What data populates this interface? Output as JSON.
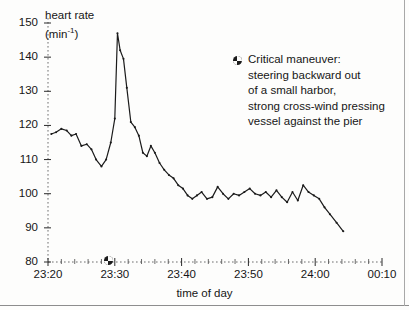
{
  "figure": {
    "background_color": "#fdfdfc",
    "line_color": "#1b1b1b",
    "axis_color": "#6f6f6f"
  },
  "axes": {
    "y_title_line1": "heart rate",
    "y_title_line2": "(min",
    "y_title_exponent": "-1",
    "y_title_line2_close": ")",
    "x_title": "time of day",
    "y_ticks": [
      "80",
      "90",
      "100",
      "110",
      "120",
      "130",
      "140",
      "150"
    ],
    "x_ticks": [
      "23:20",
      "23:30",
      "23:40",
      "23:50",
      "24:00",
      "00:10"
    ]
  },
  "annotation": {
    "marker_icon": "dot-marker-icon",
    "lines": [
      "Critical maneuver:",
      "steering backward out",
      "of a small harbor,",
      "strong cross-wind pressing",
      "vessel against the pier"
    ]
  },
  "event_marker": {
    "icon": "dot-marker-icon",
    "time": "23:29"
  },
  "chart_data": {
    "type": "line",
    "title": "",
    "subtitle": "",
    "xlabel": "time of day",
    "ylabel": "heart rate (min^-1)",
    "ylim": [
      80,
      150
    ],
    "xlim": [
      "23:20",
      "00:10"
    ],
    "grid": false,
    "legend": null,
    "y_ticks": [
      80,
      90,
      100,
      110,
      120,
      130,
      140,
      150
    ],
    "x_ticks": [
      "23:20",
      "23:30",
      "23:40",
      "23:50",
      "24:00",
      "00:10"
    ],
    "x_unit": "minutes after 23:20",
    "annotations": [
      {
        "text": "Critical maneuver: steering backward out of a small harbor, strong cross-wind pressing vessel against the pier",
        "marker_x": "23:29",
        "marker_y": 80
      }
    ],
    "series": [
      {
        "name": "heart rate",
        "x": [
          "23:20.5",
          "23:21.2",
          "23:22.0",
          "23:22.8",
          "23:23.5",
          "23:24.2",
          "23:25.0",
          "23:25.8",
          "23:26.5",
          "23:27.2",
          "23:28.0",
          "23:28.7",
          "23:29.4",
          "23:30.0",
          "23:30.4",
          "23:30.8",
          "23:31.3",
          "23:31.8",
          "23:32.4",
          "23:33.0",
          "23:33.6",
          "23:34.2",
          "23:34.8",
          "23:35.4",
          "23:36.0",
          "23:36.7",
          "23:37.4",
          "23:38.1",
          "23:38.8",
          "23:39.5",
          "23:40.2",
          "23:40.9",
          "23:41.6",
          "23:42.3",
          "23:43.0",
          "23:43.8",
          "23:44.6",
          "23:45.4",
          "23:46.2",
          "23:47.0",
          "23:47.8",
          "23:48.6",
          "23:49.4",
          "23:50.2",
          "23:51.0",
          "23:51.8",
          "23:52.6",
          "23:53.4",
          "23:54.2",
          "23:55.0",
          "23:55.8",
          "23:56.6",
          "23:57.4",
          "23:58.2",
          "23:59.0",
          "23:59.8",
          "24:00.6",
          "24:01.4",
          "24:02.2",
          "24:03.2",
          "24:04.2"
        ],
        "values": [
          117.5,
          118.0,
          119.0,
          118.5,
          117.0,
          117.5,
          114.0,
          114.5,
          113.0,
          110.0,
          108.0,
          110.0,
          115.0,
          122.0,
          147.0,
          142.0,
          139.5,
          131.0,
          121.0,
          119.5,
          117.0,
          112.0,
          111.0,
          114.0,
          112.0,
          109.0,
          107.0,
          105.5,
          104.5,
          102.5,
          101.5,
          99.5,
          98.5,
          99.5,
          100.5,
          98.5,
          99.0,
          102.0,
          100.0,
          98.5,
          100.0,
          99.5,
          100.5,
          101.5,
          100.0,
          99.5,
          100.5,
          99.0,
          101.0,
          99.0,
          97.5,
          100.5,
          98.0,
          102.5,
          100.5,
          99.5,
          98.5,
          96.0,
          94.0,
          91.5,
          89.0
        ]
      }
    ]
  }
}
